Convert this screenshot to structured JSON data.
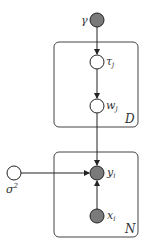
{
  "diagram": {
    "type": "probabilistic-graphical-model",
    "nodes": [
      {
        "id": "gamma",
        "label": "γ",
        "observed": true,
        "cx": 97,
        "cy": 20
      },
      {
        "id": "tau_j",
        "label": "τ",
        "sub": "j",
        "observed": false,
        "cx": 97,
        "cy": 62
      },
      {
        "id": "w_j",
        "label": "w",
        "sub": "j",
        "observed": false,
        "cx": 97,
        "cy": 106
      },
      {
        "id": "sigma2",
        "label": "σ",
        "sup": "2",
        "observed": false,
        "cx": 14,
        "cy": 173
      },
      {
        "id": "y_i",
        "label": "y",
        "sub": "i",
        "observed": true,
        "cx": 97,
        "cy": 173
      },
      {
        "id": "x_i",
        "label": "x",
        "sub": "i",
        "observed": true,
        "cx": 97,
        "cy": 216
      }
    ],
    "edges": [
      {
        "from": "gamma",
        "to": "tau_j"
      },
      {
        "from": "tau_j",
        "to": "w_j"
      },
      {
        "from": "w_j",
        "to": "y_i"
      },
      {
        "from": "sigma2",
        "to": "y_i"
      },
      {
        "from": "x_i",
        "to": "y_i"
      }
    ],
    "plates": [
      {
        "id": "plate-D",
        "label": "D",
        "x": 54,
        "y": 42,
        "w": 84,
        "h": 85
      },
      {
        "id": "plate-N",
        "label": "N",
        "x": 54,
        "y": 152,
        "w": 84,
        "h": 85
      }
    ],
    "colors": {
      "observed_fill": "#7a7a7a",
      "latent_fill": "#ffffff",
      "stroke": "#222222",
      "plate_stroke": "#444444"
    }
  },
  "labels": {
    "gamma": "γ",
    "tau": "τ",
    "tau_sub": "j",
    "w": "w",
    "w_sub": "j",
    "sigma": "σ",
    "sigma_sup": "2",
    "y": "y",
    "y_sub": "i",
    "x": "x",
    "x_sub": "i",
    "plate_D": "D",
    "plate_N": "N"
  }
}
